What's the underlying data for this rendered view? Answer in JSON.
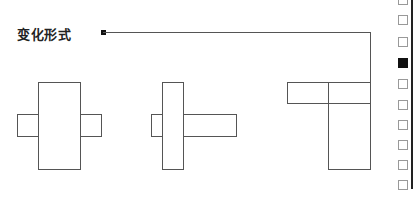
{
  "diagram": {
    "label": "变化形式",
    "connector": {
      "dot": [
        103,
        32
      ],
      "path": [
        [
          103,
          32
        ],
        [
          370,
          32
        ],
        [
          370,
          82
        ]
      ]
    },
    "shapes": [
      {
        "name": "variant-1",
        "rects": [
          [
            38,
            82,
            43,
            88
          ],
          [
            17,
            114,
            22,
            23
          ],
          [
            80,
            114,
            22,
            23
          ]
        ]
      },
      {
        "name": "variant-2",
        "rects": [
          [
            162,
            82,
            22,
            88
          ],
          [
            151,
            114,
            12,
            23
          ],
          [
            183,
            114,
            54,
            23
          ]
        ]
      },
      {
        "name": "variant-3",
        "rects": [
          [
            287,
            82,
            42,
            22
          ],
          [
            328,
            82,
            43,
            22
          ],
          [
            328,
            103,
            43,
            67
          ]
        ]
      }
    ]
  },
  "sidebar": {
    "checkboxes": [
      {
        "top": -5,
        "checked": false
      },
      {
        "top": 15,
        "checked": false
      },
      {
        "top": 37,
        "checked": false
      },
      {
        "top": 58,
        "checked": true
      },
      {
        "top": 79,
        "checked": false
      },
      {
        "top": 100,
        "checked": false
      },
      {
        "top": 120,
        "checked": false
      },
      {
        "top": 140,
        "checked": false
      },
      {
        "top": 160,
        "checked": false
      },
      {
        "top": 180,
        "checked": false
      }
    ]
  }
}
